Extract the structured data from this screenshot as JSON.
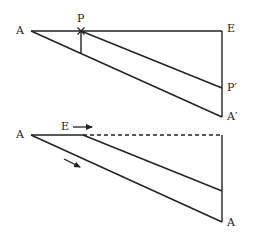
{
  "diagram": {
    "stroke_color": "#222222",
    "background": "#ffffff",
    "top": {
      "labels": {
        "apex": "A",
        "point": "P",
        "corner": "E",
        "point_image": "P′",
        "apex_image": "A′"
      },
      "marker": "×"
    },
    "bottom": {
      "labels": {
        "apex": "A",
        "point": "E",
        "apex_end": "A"
      },
      "arrows": [
        "right-arrow",
        "down-right-arrow"
      ]
    }
  }
}
